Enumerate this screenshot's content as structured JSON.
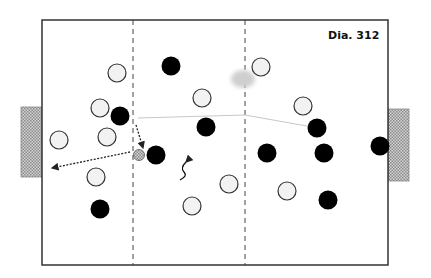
{
  "diagram": {
    "label": "Dia. 312",
    "pitch": {
      "x": 42,
      "y": 20,
      "w": 346,
      "h": 245,
      "line_color": "#333333"
    },
    "zone_lines_x": [
      133,
      245
    ],
    "goals": [
      {
        "side": "left",
        "x": 21,
        "y": 107,
        "w": 21,
        "h": 70
      },
      {
        "side": "right",
        "x": 388,
        "y": 109,
        "w": 21,
        "h": 72
      }
    ],
    "colors": {
      "white_player_fill": "#f2f2f2",
      "black_player_fill": "#000000",
      "goal_fill": "#bdbdbd",
      "shadow": "#cfcfcf"
    },
    "white_players": [
      [
        117,
        73
      ],
      [
        100,
        108
      ],
      [
        107,
        137
      ],
      [
        59,
        140
      ],
      [
        96,
        177
      ],
      [
        202,
        98
      ],
      [
        261,
        67
      ],
      [
        303,
        106
      ],
      [
        229,
        184
      ],
      [
        287,
        191
      ],
      [
        192,
        206
      ]
    ],
    "black_players": [
      [
        171,
        66
      ],
      [
        120,
        116
      ],
      [
        206,
        127
      ],
      [
        156,
        155
      ],
      [
        317,
        128
      ],
      [
        267,
        153
      ],
      [
        324,
        153
      ],
      [
        380,
        146
      ],
      [
        100,
        209
      ],
      [
        328,
        200
      ]
    ],
    "ball": [
      139,
      155
    ],
    "shadow_blob": [
      243,
      79
    ],
    "arrows": [
      {
        "type": "pass",
        "from": [
          130,
          152
        ],
        "to": [
          52,
          168
        ]
      },
      {
        "type": "run",
        "from": [
          136,
          125
        ],
        "to": [
          143,
          148
        ]
      }
    ],
    "dribble_path": "M186 162 q-6 6 -2 10 q4 4 -4 8",
    "light_line": "M138 118 L245 115 L318 128"
  }
}
